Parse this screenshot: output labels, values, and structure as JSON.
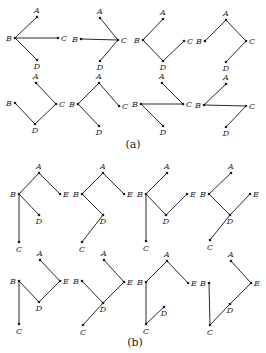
{
  "figure": {
    "parts": [
      {
        "caption": "(a)",
        "caption_pos": [
          133,
          148
        ],
        "graphs": [
          {
            "nodes": {
              "A": [
                37,
                17
              ],
              "B": [
                15,
                38
              ],
              "C": [
                58,
                38
              ],
              "D": [
                37,
                60
              ]
            },
            "edges": [
              [
                "B",
                "A"
              ],
              [
                "B",
                "C"
              ],
              [
                "B",
                "D"
              ]
            ]
          },
          {
            "nodes": {
              "A": [
                100,
                18
              ],
              "B": [
                81,
                39
              ],
              "C": [
                118,
                40
              ],
              "D": [
                100,
                61
              ]
            },
            "edges": [
              [
                "C",
                "A"
              ],
              [
                "C",
                "B"
              ],
              [
                "C",
                "D"
              ]
            ]
          },
          {
            "nodes": {
              "A": [
                163,
                19
              ],
              "B": [
                143,
                40
              ],
              "C": [
                184,
                41
              ],
              "D": [
                163,
                61
              ]
            },
            "edges": [
              [
                "B",
                "A"
              ],
              [
                "B",
                "D"
              ],
              [
                "D",
                "C"
              ]
            ]
          },
          {
            "nodes": {
              "A": [
                226,
                20
              ],
              "B": [
                205,
                41
              ],
              "C": [
                246,
                41
              ],
              "D": [
                226,
                62
              ]
            },
            "edges": [
              [
                "A",
                "B"
              ],
              [
                "A",
                "C"
              ],
              [
                "C",
                "D"
              ]
            ]
          },
          {
            "nodes": {
              "A": [
                36,
                83
              ],
              "B": [
                15,
                103
              ],
              "C": [
                56,
                104
              ],
              "D": [
                35,
                124
              ]
            },
            "edges": [
              [
                "A",
                "C"
              ],
              [
                "C",
                "D"
              ],
              [
                "D",
                "B"
              ]
            ]
          },
          {
            "nodes": {
              "A": [
                99,
                83
              ],
              "B": [
                78,
                104
              ],
              "C": [
                119,
                106
              ],
              "D": [
                99,
                126
              ]
            },
            "edges": [
              [
                "A",
                "B"
              ],
              [
                "A",
                "C"
              ],
              [
                "B",
                "D"
              ]
            ]
          },
          {
            "nodes": {
              "A": [
                162,
                83
              ],
              "B": [
                141,
                104
              ],
              "C": [
                183,
                104
              ],
              "D": [
                163,
                126
              ]
            },
            "edges": [
              [
                "A",
                "C"
              ],
              [
                "B",
                "C"
              ],
              [
                "B",
                "D"
              ]
            ]
          },
          {
            "nodes": {
              "A": [
                226,
                84
              ],
              "B": [
                204,
                105
              ],
              "C": [
                246,
                106
              ],
              "D": [
                226,
                127
              ]
            },
            "edges": [
              [
                "B",
                "A"
              ],
              [
                "B",
                "C"
              ],
              [
                "C",
                "D"
              ]
            ]
          }
        ]
      },
      {
        "caption": "(b)",
        "caption_pos": [
          135,
          346
        ],
        "graphs": [
          {
            "nodes": {
              "A": [
                39,
                173
              ],
              "B": [
                19,
                194
              ],
              "C": [
                19,
                242
              ],
              "D": [
                39,
                215
              ],
              "E": [
                60,
                194
              ]
            },
            "edges": [
              [
                "A",
                "B"
              ],
              [
                "A",
                "E"
              ],
              [
                "B",
                "C"
              ],
              [
                "B",
                "D"
              ]
            ]
          },
          {
            "nodes": {
              "A": [
                103,
                173
              ],
              "B": [
                82,
                194
              ],
              "C": [
                82,
                242
              ],
              "D": [
                103,
                215
              ],
              "E": [
                124,
                194
              ]
            },
            "edges": [
              [
                "A",
                "B"
              ],
              [
                "A",
                "E"
              ],
              [
                "B",
                "D"
              ],
              [
                "D",
                "C"
              ]
            ]
          },
          {
            "nodes": {
              "A": [
                167,
                173
              ],
              "B": [
                146,
                194
              ],
              "C": [
                146,
                241
              ],
              "D": [
                166,
                215
              ],
              "E": [
                187,
                194
              ]
            },
            "edges": [
              [
                "B",
                "A"
              ],
              [
                "B",
                "C"
              ],
              [
                "B",
                "D"
              ],
              [
                "D",
                "E"
              ]
            ]
          },
          {
            "nodes": {
              "A": [
                231,
                173
              ],
              "B": [
                209,
                194
              ],
              "C": [
                210,
                240
              ],
              "D": [
                230,
                215
              ],
              "E": [
                250,
                194
              ]
            },
            "edges": [
              [
                "B",
                "A"
              ],
              [
                "B",
                "D"
              ],
              [
                "D",
                "E"
              ],
              [
                "D",
                "C"
              ]
            ]
          },
          {
            "nodes": {
              "A": [
                40,
                260
              ],
              "B": [
                19,
                281
              ],
              "C": [
                19,
                324
              ],
              "D": [
                39,
                302
              ],
              "E": [
                60,
                281
              ]
            },
            "edges": [
              [
                "A",
                "E"
              ],
              [
                "E",
                "D"
              ],
              [
                "D",
                "B"
              ],
              [
                "B",
                "C"
              ]
            ]
          },
          {
            "nodes": {
              "A": [
                104,
                260
              ],
              "B": [
                82,
                281
              ],
              "C": [
                83,
                325
              ],
              "D": [
                103,
                303
              ],
              "E": [
                124,
                282
              ]
            },
            "edges": [
              [
                "A",
                "E"
              ],
              [
                "E",
                "D"
              ],
              [
                "B",
                "D"
              ],
              [
                "D",
                "C"
              ]
            ]
          },
          {
            "nodes": {
              "A": [
                167,
                261
              ],
              "B": [
                146,
                282
              ],
              "C": [
                146,
                324
              ],
              "D": [
                164,
                307
              ],
              "E": [
                188,
                283
              ]
            },
            "edges": [
              [
                "A",
                "B"
              ],
              [
                "A",
                "E"
              ],
              [
                "B",
                "C"
              ],
              [
                "C",
                "D"
              ]
            ]
          },
          {
            "nodes": {
              "A": [
                231,
                261
              ],
              "B": [
                209,
                283
              ],
              "C": [
                210,
                325
              ],
              "D": [
                230,
                304
              ],
              "E": [
                251,
                283
              ]
            },
            "edges": [
              [
                "A",
                "E"
              ],
              [
                "E",
                "D"
              ],
              [
                "D",
                "C"
              ],
              [
                "C",
                "B"
              ]
            ]
          }
        ]
      }
    ],
    "label_offsets": {
      "A": [
        0,
        -4,
        "middle"
      ],
      "B": [
        -3,
        3,
        "end"
      ],
      "C": [
        3,
        3,
        "start"
      ],
      "D": [
        0,
        9,
        "middle"
      ],
      "E": [
        3,
        3,
        "start"
      ]
    },
    "label_offsets_override": {
      "b.C": [
        0,
        10,
        "middle"
      ]
    }
  }
}
